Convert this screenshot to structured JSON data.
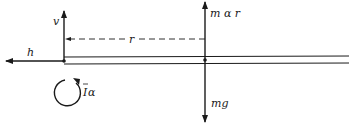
{
  "diagram": {
    "type": "free-body diagram",
    "labels": {
      "vertical_reaction": "v",
      "horizontal_reaction": "h",
      "radius": "r",
      "inertial_force": "m α r",
      "weight": "mg",
      "moment_I": "I",
      "moment_alpha": "α"
    },
    "colors": {
      "ink": "#1a1a1a",
      "background": "#ffffff"
    }
  }
}
